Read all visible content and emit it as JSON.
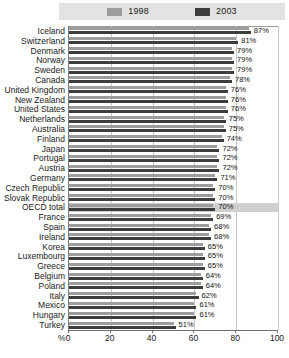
{
  "legend": {
    "items": [
      {
        "label": "1998",
        "color": "#9d9d9d",
        "icon": "legend-swatch-1998"
      },
      {
        "label": "2003",
        "color": "#3d3d3d",
        "icon": "legend-swatch-2003"
      }
    ]
  },
  "axis": {
    "unit_label": "%",
    "ticks": [
      "0",
      "20",
      "40",
      "60",
      "80",
      "100"
    ]
  },
  "chart_data": {
    "type": "bar",
    "orientation": "horizontal",
    "title": "",
    "subtitle": "",
    "xlabel": "%",
    "ylabel": "",
    "xlim": [
      0,
      100
    ],
    "grid": true,
    "legend_position": "top",
    "highlight_category": "OECD total",
    "value_labels_from_series": "2003",
    "categories": [
      "Iceland",
      "Switzerland",
      "Denmark",
      "Norway",
      "Sweden",
      "Canada",
      "United Kingdom",
      "New Zealand",
      "United States",
      "Netherlands",
      "Australia",
      "Finland",
      "Japan",
      "Portugal",
      "Austria",
      "Germany",
      "Czech Republic",
      "Slovak Republic",
      "OECD total",
      "France",
      "Spain",
      "Ireland",
      "Korea",
      "Luxembourg",
      "Greece",
      "Belgium",
      "Poland",
      "Italy",
      "Mexico",
      "Hungary",
      "Turkey"
    ],
    "series": [
      {
        "name": "1998",
        "color": "#9d9d9d",
        "values": [
          86,
          80,
          78,
          78,
          78,
          77,
          75,
          75,
          75,
          74,
          74,
          73,
          71,
          71,
          71,
          70,
          69,
          69,
          69,
          68,
          67,
          67,
          64,
          64,
          64,
          63,
          63,
          61,
          60,
          60,
          50
        ]
      },
      {
        "name": "2003",
        "color": "#3d3d3d",
        "values": [
          87,
          81,
          79,
          79,
          79,
          78,
          76,
          76,
          76,
          75,
          75,
          74,
          72,
          72,
          72,
          71,
          70,
          70,
          70,
          69,
          68,
          68,
          65,
          65,
          65,
          64,
          64,
          62,
          61,
          61,
          51
        ]
      }
    ],
    "value_labels": [
      "87%",
      "81%",
      "79%",
      "79%",
      "79%",
      "78%",
      "76%",
      "76%",
      "76%",
      "75%",
      "75%",
      "74%",
      "72%",
      "72%",
      "72%",
      "71%",
      "70%",
      "70%",
      "70%",
      "69%",
      "68%",
      "68%",
      "65%",
      "65%",
      "65%",
      "64%",
      "64%",
      "62%",
      "61%",
      "61%",
      "51%"
    ]
  }
}
